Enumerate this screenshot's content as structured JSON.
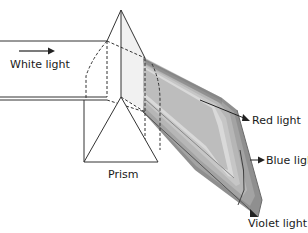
{
  "diagram": {
    "labels": {
      "white_light": "White light",
      "prism": "Prism",
      "red_light": "Red light",
      "blue_light": "Blue light",
      "violet_light": "Violet light"
    },
    "colors": {
      "line": "#333333",
      "spectrum_dark": "#8a8a8a",
      "spectrum_mid": "#a5a5a5",
      "spectrum_light": "#c9c9c9",
      "spectrum_pale": "#e2e2e2",
      "prism_face": "#efefef"
    }
  }
}
